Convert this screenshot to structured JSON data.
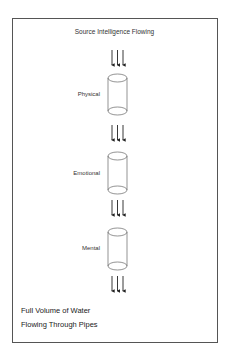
{
  "diagram": {
    "title": "Source Intelligence Flowing",
    "stages": [
      {
        "label": "Physical"
      },
      {
        "label": "Emotional"
      },
      {
        "label": "Mental"
      }
    ],
    "caption": {
      "line1": "Full Volume of Water",
      "line2": "Flowing Through Pipes"
    },
    "colors": {
      "stroke": "#444444",
      "background": "#ffffff"
    }
  }
}
